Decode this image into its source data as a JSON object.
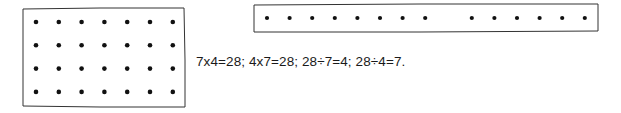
{
  "figure": {
    "array_grid": {
      "rows": 4,
      "cols": 7,
      "total": 28
    },
    "array_line": {
      "groups": [
        8,
        6
      ],
      "total": 14
    },
    "equation_text": "7x4=28;  4x7=28;  28÷7=4;  28÷4=7."
  },
  "colors": {
    "ink": "#111111",
    "frame": "#333333",
    "background": "#ffffff"
  }
}
